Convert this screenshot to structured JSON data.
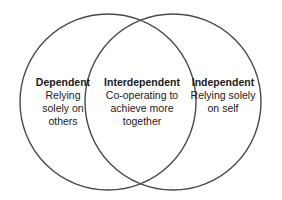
{
  "diagram": {
    "type": "venn",
    "stroke_color": "#444444",
    "sets": [
      {
        "id": "dependent",
        "title": "Dependent",
        "description": "Relying\nsolely on\nothers"
      },
      {
        "id": "interdependent",
        "title": "Interdependent",
        "description": "Co-operating to\nachieve more\ntogether"
      },
      {
        "id": "independent",
        "title": "Independent",
        "description": "Relying solely\non self"
      }
    ]
  }
}
